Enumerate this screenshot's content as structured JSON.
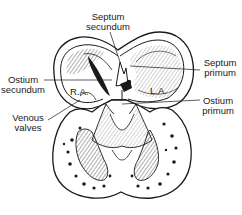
{
  "diagram": {
    "labels": {
      "septum_secundum": "Septum\nsecundum",
      "septum_primum": "Septum\nprimum",
      "ostium_secundum": "Ostium\nsecundum",
      "ostium_primum": "Ostium\nprimum",
      "venous_valves": "Venous\nvalves"
    },
    "chambers": {
      "right_atrium": "R.A.",
      "left_atrium": "L.A."
    },
    "colors": {
      "ink": "#1a1a1a",
      "background": "#ffffff"
    }
  }
}
